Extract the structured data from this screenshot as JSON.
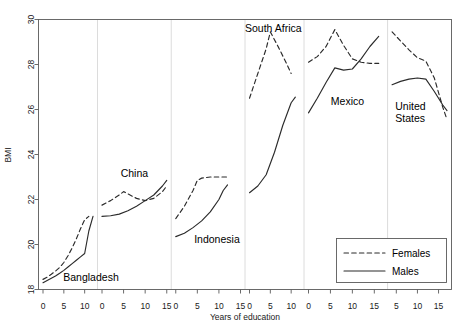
{
  "chart_data": {
    "type": "line",
    "title": "",
    "xlabel": "Years of education",
    "ylabel": "BMI",
    "ylim": [
      18,
      30
    ],
    "ytick_values": [
      18,
      20,
      22,
      24,
      26,
      28,
      30
    ],
    "ytick_labels": [
      "18",
      "20",
      "22",
      "24",
      "26",
      "28",
      "30"
    ],
    "grid": false,
    "legend": {
      "position": "bottom-right",
      "entries": [
        {
          "label": "Females",
          "style": "dashed"
        },
        {
          "label": "Males",
          "style": "solid"
        }
      ]
    },
    "facet_by": "country",
    "panels": [
      {
        "name": "Bangladesh",
        "label": "Bangladesh",
        "xlim": [
          0,
          12
        ],
        "xtick_values": [
          0,
          5,
          10
        ],
        "xtick_labels": [
          "0",
          "5",
          "10"
        ],
        "series": [
          {
            "name": "Females",
            "style": "dashed",
            "x": [
              0,
              1,
              2,
              3,
              4,
              5,
              6,
              7,
              8,
              9,
              10,
              11
            ],
            "y": [
              18.45,
              18.55,
              18.68,
              18.82,
              18.98,
              19.2,
              19.5,
              19.85,
              20.25,
              20.7,
              21.1,
              21.25
            ]
          },
          {
            "name": "Males",
            "style": "solid",
            "x": [
              0,
              1,
              2,
              3,
              4,
              5,
              6,
              7,
              8,
              9,
              10,
              11,
              12
            ],
            "y": [
              18.3,
              18.4,
              18.5,
              18.6,
              18.72,
              18.85,
              19.0,
              19.15,
              19.3,
              19.45,
              19.6,
              20.6,
              21.25
            ]
          }
        ]
      },
      {
        "name": "China",
        "label": "China",
        "xlim": [
          0,
          15
        ],
        "xtick_values": [
          0,
          5,
          10,
          15
        ],
        "xtick_labels": [
          "0",
          "5",
          "10",
          "15"
        ],
        "series": [
          {
            "name": "Females",
            "style": "dashed",
            "x": [
              0,
              2,
              4,
              5,
              6,
              8,
              10,
              12,
              14,
              15
            ],
            "y": [
              21.75,
              21.95,
              22.2,
              22.35,
              22.25,
              22.05,
              21.95,
              22.05,
              22.35,
              22.6
            ]
          },
          {
            "name": "Males",
            "style": "solid",
            "x": [
              0,
              2,
              4,
              6,
              8,
              10,
              12,
              14,
              15
            ],
            "y": [
              21.25,
              21.28,
              21.35,
              21.5,
              21.7,
              21.95,
              22.2,
              22.6,
              22.85
            ]
          }
        ]
      },
      {
        "name": "Indonesia",
        "label": "Indonesia",
        "xlim": [
          0,
          15
        ],
        "xtick_values": [
          0,
          5,
          10,
          15
        ],
        "xtick_labels": [
          "0",
          "5",
          "10",
          "15"
        ],
        "series": [
          {
            "name": "Females",
            "style": "dashed",
            "x": [
              0,
              2,
              4,
              5,
              6,
              8,
              10,
              12
            ],
            "y": [
              21.15,
              21.7,
              22.4,
              22.85,
              22.95,
              23.0,
              23.0,
              23.0
            ]
          },
          {
            "name": "Males",
            "style": "solid",
            "x": [
              0,
              2,
              4,
              6,
              8,
              10,
              11,
              12
            ],
            "y": [
              20.35,
              20.5,
              20.75,
              21.05,
              21.45,
              22.0,
              22.4,
              22.65
            ]
          }
        ]
      },
      {
        "name": "South Africa",
        "label": "South Africa",
        "xlim": [
          0,
          12
        ],
        "xtick_values": [
          0,
          5,
          10
        ],
        "xtick_labels": [
          "0",
          "5",
          "10"
        ],
        "series": [
          {
            "name": "Females",
            "style": "dashed",
            "x": [
              0,
              2,
              4,
              5,
              7,
              9,
              10
            ],
            "y": [
              26.5,
              27.6,
              28.7,
              29.45,
              28.75,
              28.0,
              27.6
            ]
          },
          {
            "name": "Males",
            "style": "solid",
            "x": [
              0,
              2,
              4,
              6,
              8,
              10,
              11
            ],
            "y": [
              22.3,
              22.6,
              23.1,
              24.1,
              25.3,
              26.3,
              26.55
            ]
          }
        ]
      },
      {
        "name": "Mexico",
        "label": "Mexico",
        "xlim": [
          0,
          17
        ],
        "xtick_values": [
          0,
          5,
          10,
          15
        ],
        "xtick_labels": [
          "0",
          "5",
          "10",
          "15"
        ],
        "series": [
          {
            "name": "Females",
            "style": "dashed",
            "x": [
              0,
              2,
              4,
              6,
              8,
              10,
              12,
              14,
              16
            ],
            "y": [
              28.1,
              28.35,
              28.8,
              29.55,
              28.85,
              28.25,
              28.1,
              28.05,
              28.05
            ]
          },
          {
            "name": "Males",
            "style": "solid",
            "x": [
              0,
              2,
              4,
              6,
              8,
              10,
              12,
              14,
              16
            ],
            "y": [
              25.85,
              26.5,
              27.2,
              27.85,
              27.75,
              27.8,
              28.25,
              28.8,
              29.25
            ]
          }
        ]
      },
      {
        "name": "United States",
        "label": "United\nStates",
        "xlim": [
          4,
          17
        ],
        "xtick_values": [
          5,
          10,
          15
        ],
        "xtick_labels": [
          "5",
          "10",
          "15"
        ],
        "series": [
          {
            "name": "Females",
            "style": "dashed",
            "x": [
              4,
              6,
              8,
              10,
              12,
              14,
              16,
              17
            ],
            "y": [
              29.45,
              29.05,
              28.65,
              28.3,
              28.15,
              27.4,
              26.1,
              25.55
            ]
          },
          {
            "name": "Males",
            "style": "solid",
            "x": [
              4,
              6,
              8,
              10,
              12,
              14,
              16,
              17
            ],
            "y": [
              27.1,
              27.25,
              27.35,
              27.4,
              27.35,
              26.8,
              26.2,
              25.95
            ]
          }
        ]
      }
    ]
  },
  "axes": {
    "y_title": "BMI",
    "x_title": "Years of education"
  },
  "colors": {
    "line": "#2b2b2b",
    "frame": "#5a5a5a",
    "divider": "#d8d8d8",
    "background": "#ffffff"
  }
}
